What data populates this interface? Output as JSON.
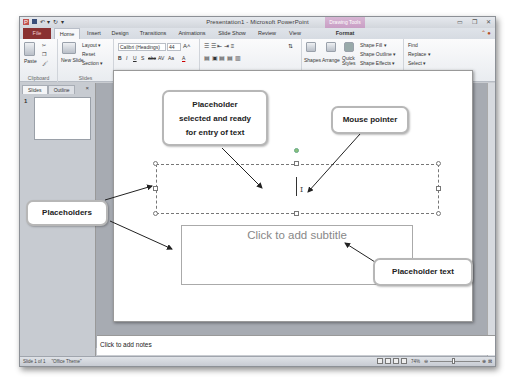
{
  "window": {
    "title": "Presentation1 - Microsoft PowerPoint",
    "context_tab": "Drawing Tools",
    "controls": [
      "minimize-icon",
      "restore-icon",
      "close-icon"
    ]
  },
  "quick_access": {
    "app_icon": "P",
    "save": "save-icon",
    "undo": "↶ ▾",
    "redo": "↻",
    "customize": "▾"
  },
  "tabs": [
    {
      "label": "File"
    },
    {
      "label": "Home"
    },
    {
      "label": "Insert"
    },
    {
      "label": "Design"
    },
    {
      "label": "Transitions"
    },
    {
      "label": "Animations"
    },
    {
      "label": "Slide Show"
    },
    {
      "label": "Review"
    },
    {
      "label": "View"
    },
    {
      "label": "Format"
    }
  ],
  "ribbon": {
    "clipboard": {
      "label": "Clipboard",
      "paste": "Paste"
    },
    "slides": {
      "label": "Slides",
      "new_slide": "New Slide",
      "layout": "Layout ▾",
      "reset": "Reset",
      "section": "Section ▾"
    },
    "font": {
      "label": "Font",
      "font_name": "Calibri (Headings)",
      "font_size": "44",
      "buttons": [
        "B",
        "I",
        "U",
        "S",
        "abc",
        "AV",
        "Aa",
        "A"
      ]
    },
    "paragraph": {
      "label": "Paragraph"
    },
    "drawing": {
      "label": "Drawing",
      "shapes": "Shapes",
      "arrange": "Arrange",
      "quick_styles": "Quick Styles",
      "shape_fill": "Shape Fill ▾",
      "shape_outline": "Shape Outline ▾",
      "shape_effects": "Shape Effects ▾"
    },
    "editing": {
      "label": "Editing",
      "find": "Find",
      "replace": "Replace ▾",
      "select": "Select ▾"
    }
  },
  "side_panel": {
    "tabs": [
      "Slides",
      "Outline"
    ],
    "close": "×",
    "slide_number": "1"
  },
  "slide": {
    "subtitle_placeholder": "Click to add subtitle"
  },
  "notes": {
    "placeholder": "Click to add notes"
  },
  "status": {
    "slide_info": "Slide 1 of 1",
    "theme": "\"Office Theme\"",
    "zoom": "74%"
  },
  "callouts": {
    "selected": [
      "Placeholder",
      "selected and ready",
      "for entry of text"
    ],
    "mouse": "Mouse pointer",
    "placeholders": "Placeholders",
    "placeholder_text": "Placeholder text"
  }
}
